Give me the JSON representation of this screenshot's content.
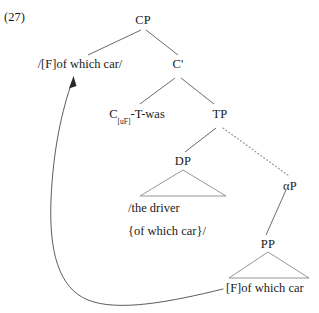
{
  "example": {
    "number": "(27)"
  },
  "tree": {
    "nodes": {
      "cp": "CP",
      "spec_cp": "/[F]of which car/",
      "c_bar": "C'",
      "c_head_main": "C",
      "c_head_subscript": "[uF]",
      "c_head_suffix": "-T-was",
      "tp": "TP",
      "dp": "DP",
      "dp_terminal_line1": "/the driver",
      "dp_terminal_line2": "{of which car}/",
      "alpha_p": "αP",
      "pp": "PP",
      "pp_terminal": "[F]of which car"
    },
    "edges": [
      {
        "name": "cp-to-spec",
        "style": "solid"
      },
      {
        "name": "cp-to-cbar",
        "style": "solid"
      },
      {
        "name": "cbar-to-chead",
        "style": "solid"
      },
      {
        "name": "cbar-to-tp",
        "style": "solid"
      },
      {
        "name": "tp-to-dp",
        "style": "solid"
      },
      {
        "name": "tp-to-alphap",
        "style": "dotted"
      },
      {
        "name": "alphap-to-pp",
        "style": "solid"
      }
    ],
    "triangles": [
      {
        "name": "dp-triangle"
      },
      {
        "name": "pp-triangle"
      }
    ],
    "movement_arrow": {
      "name": "movement-arrow",
      "from": "[F]of which car",
      "to": "/[F]of which car/"
    }
  },
  "colors": {
    "ink": "#1a1a1a",
    "line": "#5a5a5a",
    "background": "#ffffff"
  }
}
